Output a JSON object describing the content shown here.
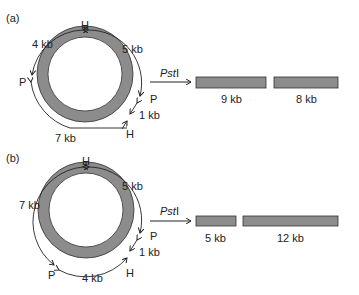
{
  "panels": [
    {
      "label": "(a)",
      "enzyme": "PstI",
      "enzyme_prefix": "Pst",
      "enzyme_suffix": "I",
      "sites": {
        "top": "H",
        "left": "P",
        "right": "P",
        "bottom_right": "H"
      },
      "segments": {
        "top_left": "4 kb",
        "top_right": "5 kb",
        "right": "1 kb",
        "bottom": "7 kb"
      },
      "fragments": [
        {
          "label": "9 kb",
          "size": 9
        },
        {
          "label": "8 kb",
          "size": 8
        }
      ]
    },
    {
      "label": "(b)",
      "enzyme": "PstI",
      "enzyme_prefix": "Pst",
      "enzyme_suffix": "I",
      "sites": {
        "top": "H",
        "bottom_left": "P",
        "right": "P",
        "bottom_right": "H"
      },
      "segments": {
        "left": "7 kb",
        "top_right": "5 kb",
        "right": "1 kb",
        "bottom": "4 kb"
      },
      "fragments": [
        {
          "label": "5 kb",
          "size": 5
        },
        {
          "label": "12 kb",
          "size": 12
        }
      ]
    }
  ],
  "colors": {
    "ring": "#8c8c8c",
    "ring_stroke": "#333333",
    "band": "#8c8c8c",
    "line": "#222222"
  }
}
